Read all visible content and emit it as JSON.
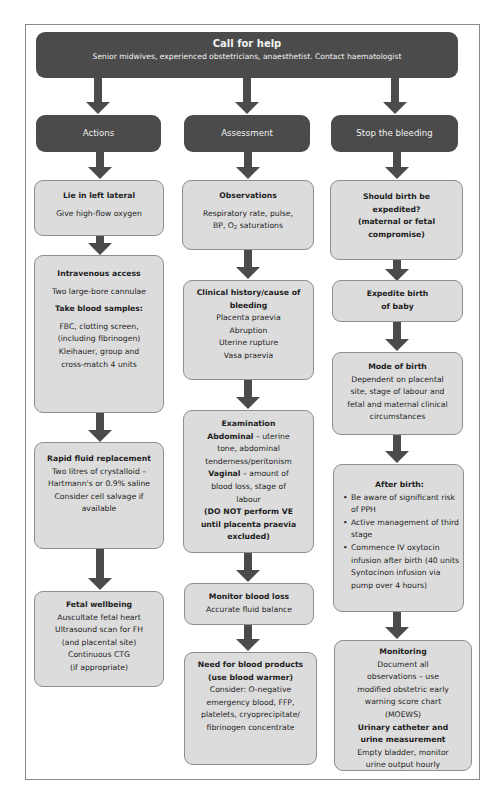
{
  "banner": {
    "title": "Call for help",
    "subtitle": "Senior midwives, experienced obstetricians, anaesthetist. Contact haematologist"
  },
  "columns": [
    {
      "header": "Actions",
      "boxes": [
        {
          "title": "Lie in left lateral",
          "lines": [
            "Give high-flow oxygen"
          ]
        },
        {
          "title": "Intravenous access",
          "lines": [
            "Two large-bore cannulae"
          ],
          "subtitle": "Take blood samples:",
          "sublines": [
            "FBC, clotting screen,",
            "(including fibrinogen)",
            "Kleihauer, group and",
            "cross-match 4 units"
          ]
        },
        {
          "title": "Rapid fluid replacement",
          "lines": [
            "Two litres of crystalloid –",
            "Hartmann's or 0.9% saline",
            "Consider cell salvage if",
            "available"
          ]
        },
        {
          "title": "Fetal wellbeing",
          "lines": [
            "Auscultate fetal heart",
            "Ultrasound scan for FH",
            "(and placental site)",
            "Continuous CTG",
            "(if appropriate)"
          ]
        }
      ]
    },
    {
      "header": "Assessment",
      "boxes": [
        {
          "title": "Observations",
          "lines": [
            "Respiratory rate, pulse,",
            "BP, O",
            "2",
            " saturations"
          ]
        },
        {
          "title": "Clinical history/cause of bleeding",
          "title_lines": [
            "Clinical history/cause of",
            "bleeding"
          ],
          "lines": [
            "Placenta praevia",
            "Abruption",
            "Uterine rupture",
            "Vasa praevia"
          ]
        },
        {
          "title": "Examination",
          "abdominal_label": "Abdominal",
          "abdominal_text": " – uterine",
          "abdominal_lines": [
            "tone, abdominal",
            "tenderness/peritonism"
          ],
          "vaginal_label": "Vaginal",
          "vaginal_text": " – amount of",
          "vaginal_lines": [
            "blood loss, stage of",
            "labour"
          ],
          "warning_lines": [
            "(DO NOT perform VE",
            "until placenta praevia",
            "excluded)"
          ]
        },
        {
          "title": "Monitor blood loss",
          "lines": [
            "Accurate fluid balance"
          ]
        },
        {
          "title_lines": [
            "Need for blood products",
            "(use blood warmer)"
          ],
          "lines": [
            "Consider: O-negative",
            "emergency blood, FFP,",
            "platelets, cryoprecipitate/",
            "fibrinogen concentrate"
          ]
        }
      ]
    },
    {
      "header": "Stop the bleeding",
      "boxes": [
        {
          "title_lines": [
            "Should birth be",
            "expedited?",
            "(maternal or fetal",
            "compromise)"
          ]
        },
        {
          "title_lines": [
            "Expedite birth",
            "of baby"
          ]
        },
        {
          "title": "Mode of birth",
          "lines": [
            "Dependent on placental",
            "site, stage of labour and",
            "fetal and maternal clinical",
            "circumstances"
          ]
        },
        {
          "title": "After birth:",
          "bullets": [
            "Be aware of significant risk of PPH",
            "Active management of third stage",
            "Commence IV oxytocin infusion after birth (40 units Syntocinon infusion via pump over 4 hours)"
          ]
        },
        {
          "title": "Monitoring",
          "lines": [
            "Document all",
            "observations – use",
            "modified obstetric early",
            "warning score chart",
            "(MOEWS)"
          ],
          "subtitle_lines": [
            "Urinary catheter and",
            "urine measurement"
          ],
          "sublines": [
            "Empty bladder, monitor",
            "urine output hourly"
          ]
        }
      ]
    }
  ],
  "colors": {
    "dark_fill": "#4b4b4b",
    "box_fill": "#dcdcdc",
    "box_border": "#8e8e8e",
    "frame_border": "#8a8a8a"
  }
}
